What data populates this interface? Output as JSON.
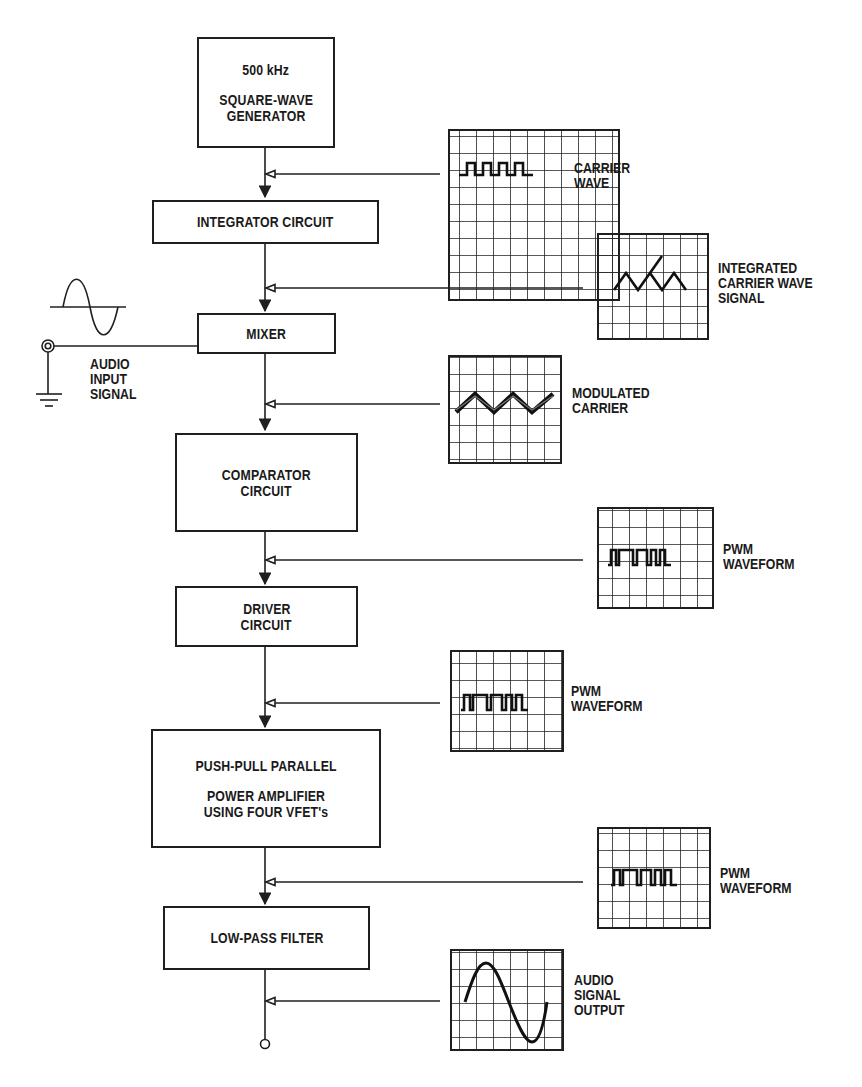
{
  "diagram": {
    "blocks": [
      {
        "id": "generator",
        "lines": [
          "500 kHz",
          "",
          "SQUARE-WAVE",
          "GENERATOR"
        ]
      },
      {
        "id": "integrator",
        "lines": [
          "INTEGRATOR CIRCUIT"
        ]
      },
      {
        "id": "mixer",
        "lines": [
          "MIXER"
        ]
      },
      {
        "id": "comparator",
        "lines": [
          "COMPARATOR",
          "CIRCUIT"
        ]
      },
      {
        "id": "driver",
        "lines": [
          "DRIVER",
          "CIRCUIT"
        ]
      },
      {
        "id": "amplifier",
        "lines": [
          "PUSH-PULL PARALLEL",
          "",
          "POWER AMPLIFIER",
          "USING FOUR VFET's"
        ]
      },
      {
        "id": "filter",
        "lines": [
          "LOW-PASS FILTER"
        ]
      }
    ],
    "scopes": [
      {
        "id": "carrier",
        "waveform": "square",
        "label": [
          "CARRIER",
          "WAVE"
        ]
      },
      {
        "id": "integrated",
        "waveform": "triangle",
        "label": [
          "INTEGRATED",
          "CARRIER WAVE",
          "SIGNAL"
        ]
      },
      {
        "id": "modulated",
        "waveform": "modulated-triangle",
        "label": [
          "MODULATED",
          "CARRIER"
        ]
      },
      {
        "id": "pwm1",
        "waveform": "pwm",
        "label": [
          "PWM",
          "WAVEFORM"
        ]
      },
      {
        "id": "pwm2",
        "waveform": "pwm",
        "label": [
          "PWM",
          "WAVEFORM"
        ]
      },
      {
        "id": "pwm3",
        "waveform": "pwm",
        "label": [
          "PWM",
          "WAVEFORM"
        ]
      },
      {
        "id": "output",
        "waveform": "sine",
        "label": [
          "AUDIO",
          "SIGNAL",
          "OUTPUT"
        ]
      }
    ],
    "audio_input": {
      "label": [
        "AUDIO",
        "INPUT",
        "SIGNAL"
      ],
      "waveform": "sine"
    },
    "colors": {
      "ink": "#1f1f1f",
      "background": "#ffffff"
    }
  }
}
